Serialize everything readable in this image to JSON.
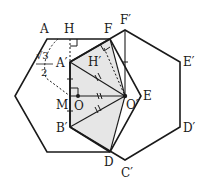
{
  "diagram": {
    "colors": {
      "stroke": "#1a1a1a",
      "fill_shaded": "#e6e6e6",
      "background": "#ffffff"
    },
    "labels": {
      "A": "A",
      "H": "H",
      "F": "F",
      "F_prime": "F′",
      "E_prime": "E′",
      "A_prime": "A′",
      "H_prime": "H′",
      "sqrt3": "√3",
      "denominator": "2",
      "M": "M",
      "O": "O",
      "O_prime": "O′",
      "E": "E",
      "B_prime": "B′",
      "D_prime": "D′",
      "D": "D",
      "C_prime": "C′"
    },
    "annotations": {
      "fraction": "√3/2",
      "right_angle_marks": [
        "H",
        "H′",
        "M"
      ]
    }
  }
}
